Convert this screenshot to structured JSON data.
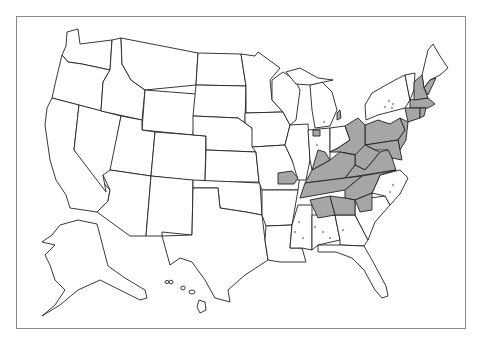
{
  "map": {
    "type": "choropleth",
    "region": "United States",
    "frame": {
      "border_color": "#8a8a8a"
    },
    "colors": {
      "unshaded": "#ffffff",
      "shaded": "#a6a6a6",
      "outline": "#222222"
    },
    "legend": null,
    "shaded_states_full": [
      "Pennsylvania",
      "West Virginia",
      "Kentucky",
      "Tennessee",
      "Virginia",
      "Maryland",
      "New Jersey",
      "Connecticut",
      "Rhode Island",
      "Massachusetts",
      "New Hampshire",
      "Delaware",
      "Ohio (east)",
      "Alabama (north)",
      "Georgia (north)",
      "South Carolina (northwest)",
      "North Carolina (west)"
    ],
    "shaded_states_partial": [
      "Illinois (south)",
      "Indiana (south)",
      "Missouri (east)",
      "Michigan (spot)",
      "New York (spots)",
      "Mississippi (spots)",
      "Alabama (spots)",
      "Georgia (spots)",
      "North Carolina (spots)",
      "Vermont (partial)",
      "Maine (coast)"
    ],
    "insets": [
      "Alaska",
      "Hawaii"
    ]
  }
}
